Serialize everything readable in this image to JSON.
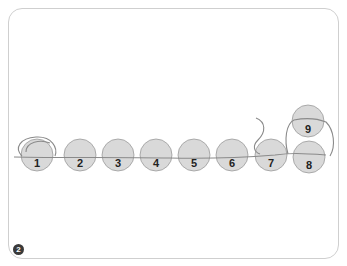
{
  "diagram": {
    "step_number": "2",
    "beads": [
      {
        "label": "1",
        "cx": 37,
        "cy": 155
      },
      {
        "label": "2",
        "cx": 80,
        "cy": 155
      },
      {
        "label": "3",
        "cx": 118,
        "cy": 155
      },
      {
        "label": "4",
        "cx": 156,
        "cy": 155
      },
      {
        "label": "5",
        "cx": 194,
        "cy": 155
      },
      {
        "label": "6",
        "cx": 232,
        "cy": 155
      },
      {
        "label": "7",
        "cx": 271,
        "cy": 155
      },
      {
        "label": "8",
        "cx": 309,
        "cy": 157
      },
      {
        "label": "9",
        "cx": 308,
        "cy": 121
      }
    ],
    "colors": {
      "bead_fill": "#d9d9d9",
      "bead_stroke": "#9a9a9a",
      "thread": "#8a8a8a",
      "frame_border": "#cfcfcf",
      "badge": "#3a3a3a"
    }
  }
}
